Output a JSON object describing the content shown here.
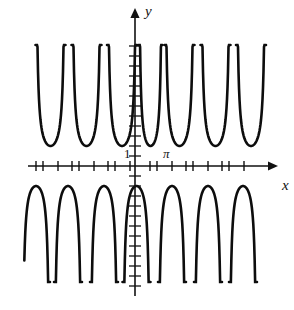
{
  "figure": {
    "kind": "math-plot",
    "background": "#ffffff",
    "ink_color": "#111111"
  },
  "axes": {
    "x_axis_label": "x",
    "y_axis_label": "y",
    "origin_px": [
      135,
      166
    ],
    "x_axis_y_px": 166,
    "y_axis_x_px": 135,
    "x_axis_range_px": [
      28,
      268
    ],
    "y_axis_range_px": [
      18,
      296
    ],
    "arrows": [
      "x-right",
      "y-up"
    ],
    "tick_labels": [
      {
        "name": "one-label",
        "text": "1",
        "x_px": 124,
        "y_px": 158
      },
      {
        "name": "pi-label",
        "text": "π",
        "x_px": 163,
        "y_px": 158
      }
    ],
    "x_ticks_px": [
      36,
      43,
      58,
      72,
      79,
      94,
      108,
      115,
      130,
      150,
      157,
      172,
      186,
      193,
      208,
      222,
      229,
      244
    ],
    "y_ticks_upper_px": [
      156,
      146,
      136,
      126,
      116,
      106,
      96,
      86,
      76,
      66,
      56,
      46
    ],
    "y_ticks_lower_px": [
      176,
      186,
      196,
      206,
      216,
      226,
      236,
      246,
      256,
      266,
      276,
      286
    ]
  },
  "chart_data": {
    "type": "line",
    "title": "",
    "xlabel": "x",
    "ylabel": "y",
    "function_family": "cosecant-like reciprocal trigonometric curve",
    "grid": false,
    "legend": null,
    "axis_arrowheads": true,
    "xlim_px": [
      28,
      268
    ],
    "ylim_px": [
      18,
      296
    ],
    "upper_branches": [
      {
        "center_px": 50.5,
        "half_width_px": 15.0,
        "vertex_y_px": 146,
        "top_y_px": 45
      },
      {
        "center_px": 86.5,
        "half_width_px": 15.0,
        "vertex_y_px": 146,
        "top_y_px": 45
      },
      {
        "center_px": 122.0,
        "half_width_px": 15.0,
        "vertex_y_px": 146,
        "top_y_px": 45
      },
      {
        "center_px": 150.5,
        "half_width_px": 12.0,
        "vertex_y_px": 146,
        "top_y_px": 45
      },
      {
        "center_px": 179.5,
        "half_width_px": 15.0,
        "vertex_y_px": 146,
        "top_y_px": 45
      },
      {
        "center_px": 215.5,
        "half_width_px": 15.0,
        "vertex_y_px": 146,
        "top_y_px": 45
      },
      {
        "center_px": 251.0,
        "half_width_px": 15.0,
        "vertex_y_px": 146,
        "top_y_px": 45
      }
    ],
    "lower_branches": [
      {
        "center_px": 36.0,
        "half_width_px": 14.0,
        "vertex_y_px": 186,
        "bottom_y_px": 282
      },
      {
        "center_px": 68.0,
        "half_width_px": 14.0,
        "vertex_y_px": 186,
        "bottom_y_px": 282
      },
      {
        "center_px": 104.0,
        "half_width_px": 14.0,
        "vertex_y_px": 186,
        "bottom_y_px": 282
      },
      {
        "center_px": 136.5,
        "half_width_px": 14.0,
        "vertex_y_px": 186,
        "bottom_y_px": 282
      },
      {
        "center_px": 172.0,
        "half_width_px": 14.0,
        "vertex_y_px": 186,
        "bottom_y_px": 282
      },
      {
        "center_px": 208.0,
        "half_width_px": 14.0,
        "vertex_y_px": 186,
        "bottom_y_px": 282
      },
      {
        "center_px": 243.0,
        "half_width_px": 14.0,
        "vertex_y_px": 186,
        "bottom_y_px": 282
      }
    ]
  }
}
